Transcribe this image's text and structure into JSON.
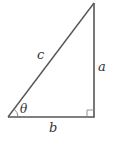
{
  "diagram": {
    "type": "right-triangle",
    "stroke_color": "#555555",
    "label_color": "#333333",
    "vertices": {
      "left": [
        8,
        117
      ],
      "right_angle": [
        94,
        117
      ],
      "top": [
        94,
        3
      ]
    },
    "labels": {
      "hypotenuse": "c",
      "vertical_leg": "a",
      "horizontal_leg": "b",
      "angle": "θ"
    },
    "right_angle_marker": true
  }
}
